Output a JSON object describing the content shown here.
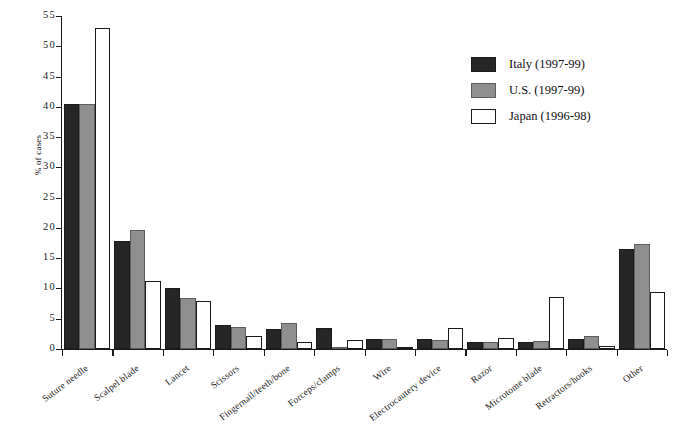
{
  "chart_data": {
    "type": "bar",
    "title": "",
    "xlabel": "",
    "ylabel": "% of cases",
    "ylim": [
      0,
      55
    ],
    "yticks": [
      0,
      5,
      10,
      15,
      20,
      25,
      30,
      35,
      40,
      45,
      50,
      55
    ],
    "ytick_labels": [
      "0",
      "5",
      "10",
      "15",
      "20",
      "25",
      "30",
      "35",
      "40",
      "45",
      "50",
      "55"
    ],
    "grid": false,
    "legend_position": "upper right",
    "categories": [
      "Suture needle",
      "Scalpel blade",
      "Lancet",
      "Scissors",
      "Fingernail/teeth/bone",
      "Forceps/clamps",
      "Wire",
      "Electrocautery device",
      "Razor",
      "Microtome blade",
      "Retractors/hooks",
      "Other"
    ],
    "series": [
      {
        "name": "Italy (1997-99)",
        "color": "#262626",
        "values": [
          40.5,
          17.8,
          10.0,
          4.0,
          3.3,
          3.4,
          1.7,
          1.6,
          1.2,
          1.2,
          1.6,
          16.5
        ]
      },
      {
        "name": "U.S. (1997-99)",
        "color": "#8f8f8f",
        "values": [
          40.5,
          19.6,
          8.5,
          3.7,
          4.3,
          0.4,
          1.7,
          1.5,
          1.2,
          1.3,
          2.2,
          17.3
        ]
      },
      {
        "name": "Japan (1996-98)",
        "color": "#ffffff",
        "values": [
          53.0,
          11.2,
          8.0,
          2.2,
          1.2,
          1.5,
          0.3,
          3.4,
          1.8,
          8.6,
          0.5,
          9.4
        ]
      }
    ]
  },
  "legend": {
    "entries": [
      {
        "label": "Italy (1997-99)",
        "swatch": "italy"
      },
      {
        "label": "U.S. (1997-99)",
        "swatch": "us"
      },
      {
        "label": "Japan (1996-98)",
        "swatch": "japan"
      }
    ]
  }
}
